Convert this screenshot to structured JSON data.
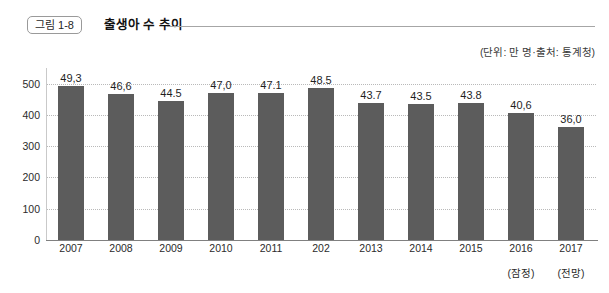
{
  "header": {
    "badge": "그림 1-8",
    "title": "출생아 수 추이",
    "unit_note": "(단위: 만 명·출처: 통계청)"
  },
  "chart_data": {
    "type": "bar",
    "title": "출생아 수 추이",
    "subtitle": "(단위: 만 명·출처: 통계청)",
    "xlabel": "",
    "ylabel": "",
    "ylim": [
      0,
      550
    ],
    "grid": true,
    "legend": false,
    "yticks": [
      0,
      100,
      200,
      300,
      400,
      500
    ],
    "ytick_labels": [
      "0",
      "100",
      "200",
      "300",
      "400",
      "500"
    ],
    "categories": [
      "2007",
      "2008",
      "2009",
      "2010",
      "2011",
      "202",
      "2013",
      "2014",
      "2015",
      "2016",
      "2017"
    ],
    "category_notes": [
      "",
      "",
      "",
      "",
      "",
      "",
      "",
      "",
      "",
      "(잠정)",
      "(전망)"
    ],
    "values": [
      493,
      466,
      445,
      470,
      471,
      485,
      437,
      435,
      438,
      406,
      360
    ],
    "value_labels": [
      "49,3",
      "46,6",
      "44.5",
      "47,0",
      "47.1",
      "48.5",
      "43.7",
      "43.5",
      "43.8",
      "40,6",
      "36,0"
    ],
    "bar_color": "#5c5c5c",
    "grid_color": "#b9b9b9",
    "axis_color": "#808080",
    "background": "#ffffff"
  }
}
